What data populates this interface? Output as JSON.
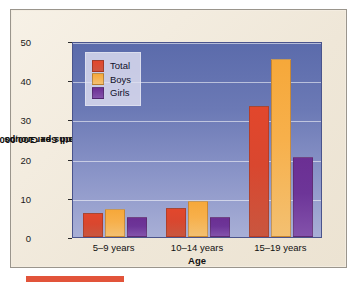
{
  "chart_data": {
    "type": "bar",
    "title": "",
    "categories": [
      "5–9 years",
      "10–14 years",
      "15–19 years"
    ],
    "series": [
      {
        "name": "Total",
        "color": "#e2472c",
        "values": [
          6.2,
          7.3,
          33.3
        ]
      },
      {
        "name": "Boys",
        "color": "#f6a83a",
        "values": [
          7.1,
          9.2,
          45.4
        ]
      },
      {
        "name": "Girls",
        "color": "#6b2f93",
        "values": [
          5.0,
          5.2,
          20.4
        ]
      }
    ],
    "xlabel": "Age",
    "ylabel": "Deaths per 100,000 Within Age and Sex Groups",
    "ylabel_lines": [
      "Deaths per 100,000 Within",
      "Age and Sex Groups"
    ],
    "ylim": [
      0,
      50
    ],
    "yticks": [
      0,
      10,
      20,
      30,
      40,
      50
    ],
    "ytick_labels": [
      "0",
      "10",
      "20",
      "30",
      "40",
      "50"
    ],
    "grid": "horizontal",
    "legend_position": "top-left",
    "legend_entries": [
      "Total",
      "Boys",
      "Girls"
    ]
  },
  "colors": {
    "page_background": "#f3ece0",
    "plot_background_top": "#5b6bab",
    "plot_background_bottom": "#a8afd6",
    "gridline": "#ffffff",
    "frame_border": "#9a958c",
    "marker_bar": "#e2543a"
  }
}
